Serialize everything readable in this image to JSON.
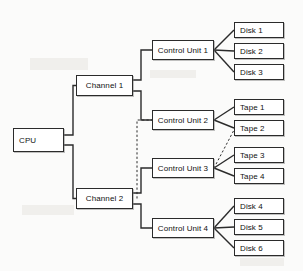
{
  "diagram": {
    "type": "block-diagram",
    "line_color": "#2b2b2b",
    "box_fill": "#ffffff",
    "background": "#fbfbfa",
    "nodes": [
      {
        "id": "cpu",
        "label": "CPU",
        "x": 13,
        "y": 128,
        "w": 51,
        "h": 24,
        "align": "pad-left"
      },
      {
        "id": "ch1",
        "label": "Channel 1",
        "x": 76,
        "y": 75,
        "w": 57,
        "h": 21,
        "align": "center"
      },
      {
        "id": "ch2",
        "label": "Channel 2",
        "x": 76,
        "y": 188,
        "w": 57,
        "h": 21,
        "align": "center"
      },
      {
        "id": "cu1",
        "label": "Control Unit 1",
        "x": 152,
        "y": 40,
        "w": 62,
        "h": 20,
        "align": "center"
      },
      {
        "id": "cu2",
        "label": "Control Unit 2",
        "x": 152,
        "y": 110,
        "w": 62,
        "h": 20,
        "align": "center"
      },
      {
        "id": "cu3",
        "label": "Control Unit 3",
        "x": 152,
        "y": 158,
        "w": 62,
        "h": 20,
        "align": "center"
      },
      {
        "id": "cu4",
        "label": "Control Unit 4",
        "x": 152,
        "y": 218,
        "w": 62,
        "h": 20,
        "align": "center"
      },
      {
        "id": "dsk1",
        "label": "Disk 1",
        "x": 234,
        "y": 22,
        "w": 50,
        "h": 16,
        "align": "pad-left"
      },
      {
        "id": "dsk2",
        "label": "Disk 2",
        "x": 234,
        "y": 43,
        "w": 50,
        "h": 16,
        "align": "pad-left"
      },
      {
        "id": "dsk3",
        "label": "Disk 3",
        "x": 234,
        "y": 64,
        "w": 50,
        "h": 16,
        "align": "pad-left"
      },
      {
        "id": "tp1",
        "label": "Tape 1",
        "x": 234,
        "y": 99,
        "w": 50,
        "h": 16,
        "align": "pad-left"
      },
      {
        "id": "tp2",
        "label": "Tape 2",
        "x": 234,
        "y": 120,
        "w": 50,
        "h": 16,
        "align": "pad-left"
      },
      {
        "id": "tp3",
        "label": "Tape 3",
        "x": 234,
        "y": 147,
        "w": 50,
        "h": 16,
        "align": "pad-left"
      },
      {
        "id": "tp4",
        "label": "Tape 4",
        "x": 234,
        "y": 168,
        "w": 50,
        "h": 16,
        "align": "pad-left"
      },
      {
        "id": "dsk4",
        "label": "Disk 4",
        "x": 234,
        "y": 198,
        "w": 50,
        "h": 16,
        "align": "pad-left"
      },
      {
        "id": "dsk5",
        "label": "Disk 5",
        "x": 234,
        "y": 219,
        "w": 50,
        "h": 16,
        "align": "pad-left"
      },
      {
        "id": "dsk6",
        "label": "Disk 6",
        "x": 234,
        "y": 240,
        "w": 50,
        "h": 16,
        "align": "pad-left"
      }
    ],
    "connections": [
      {
        "id": "cpu-ch1",
        "from": "cpu",
        "to": "ch1",
        "style": "solid",
        "path": "M 64 135 L 73 135 L 73 85.5 L 76 85.5"
      },
      {
        "id": "cpu-ch2",
        "from": "cpu",
        "to": "ch2",
        "style": "solid",
        "path": "M 64 145 L 73 145 L 73 198.5 L 76 198.5"
      },
      {
        "id": "ch1-cu1",
        "from": "ch1",
        "to": "cu1",
        "style": "solid",
        "path": "M 133 80 L 141 80 L 141 50 L 152 50"
      },
      {
        "id": "ch1-cu2",
        "from": "ch1",
        "to": "cu2",
        "style": "solid",
        "path": "M 133 91 L 141 91 L 141 120 L 152 120"
      },
      {
        "id": "ch2-cu3",
        "from": "ch2",
        "to": "cu3",
        "style": "solid",
        "path": "M 133 193 L 141 193 L 141 168 L 152 168"
      },
      {
        "id": "ch2-cu4",
        "from": "ch2",
        "to": "cu4",
        "style": "solid",
        "path": "M 133 204 L 141 204 L 141 228 L 152 228"
      },
      {
        "id": "ch2-cu2",
        "from": "ch2",
        "to": "cu2",
        "style": "dashed",
        "path": "M 137 198.5 L 137 120 L 152 120"
      },
      {
        "id": "cu1-dsk1",
        "from": "cu1",
        "to": "dsk1",
        "style": "solid",
        "path": "M 214 50 L 234 30"
      },
      {
        "id": "cu1-dsk2",
        "from": "cu1",
        "to": "dsk2",
        "style": "solid",
        "path": "M 214 50 L 234 51"
      },
      {
        "id": "cu1-dsk3",
        "from": "cu1",
        "to": "dsk3",
        "style": "solid",
        "path": "M 214 50 L 234 72"
      },
      {
        "id": "cu2-tp1",
        "from": "cu2",
        "to": "tp1",
        "style": "solid",
        "path": "M 214 120 L 234 107"
      },
      {
        "id": "cu2-tp2",
        "from": "cu2",
        "to": "tp2",
        "style": "solid",
        "path": "M 214 120 L 234 128"
      },
      {
        "id": "cu3-tp3",
        "from": "cu3",
        "to": "tp3",
        "style": "solid",
        "path": "M 214 168 L 234 155"
      },
      {
        "id": "cu3-tp4",
        "from": "cu3",
        "to": "tp4",
        "style": "solid",
        "path": "M 214 168 L 234 176"
      },
      {
        "id": "cu3-tp2",
        "from": "cu3",
        "to": "tp2",
        "style": "dashed",
        "path": "M 214 168 L 234 130"
      },
      {
        "id": "cu4-dsk4",
        "from": "cu4",
        "to": "dsk4",
        "style": "solid",
        "path": "M 214 228 L 234 206"
      },
      {
        "id": "cu4-dsk5",
        "from": "cu4",
        "to": "dsk5",
        "style": "solid",
        "path": "M 214 228 L 234 227"
      },
      {
        "id": "cu4-dsk6",
        "from": "cu4",
        "to": "dsk6",
        "style": "solid",
        "path": "M 214 228 L 234 248"
      }
    ]
  }
}
